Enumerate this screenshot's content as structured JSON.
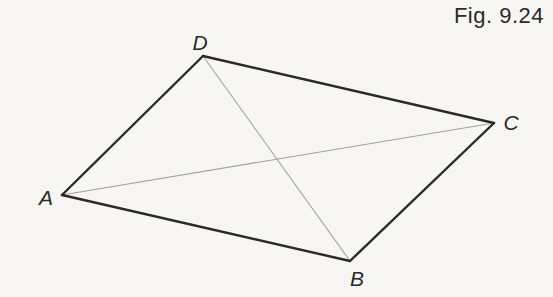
{
  "figure": {
    "caption": "Fig. 9.24",
    "type": "geometry-diagram"
  },
  "diagram": {
    "vertices": [
      {
        "id": "A",
        "label": "A",
        "x": 62,
        "y": 195,
        "label_x": 46,
        "label_y": 205
      },
      {
        "id": "B",
        "label": "B",
        "x": 350,
        "y": 261,
        "label_x": 357,
        "label_y": 286
      },
      {
        "id": "C",
        "label": "C",
        "x": 494,
        "y": 123,
        "label_x": 511,
        "label_y": 130
      },
      {
        "id": "D",
        "label": "D",
        "x": 203,
        "y": 56,
        "label_x": 200,
        "label_y": 50
      }
    ],
    "edges": [
      {
        "from": "A",
        "to": "B"
      },
      {
        "from": "B",
        "to": "C"
      },
      {
        "from": "C",
        "to": "D"
      },
      {
        "from": "D",
        "to": "A"
      }
    ],
    "diagonals": [
      {
        "from": "A",
        "to": "C"
      },
      {
        "from": "D",
        "to": "B"
      }
    ],
    "colors": {
      "background": "#f7f6f3",
      "edge": "#2b2a27",
      "diagonal": "#a3a19d",
      "text": "#2b2a27"
    }
  }
}
